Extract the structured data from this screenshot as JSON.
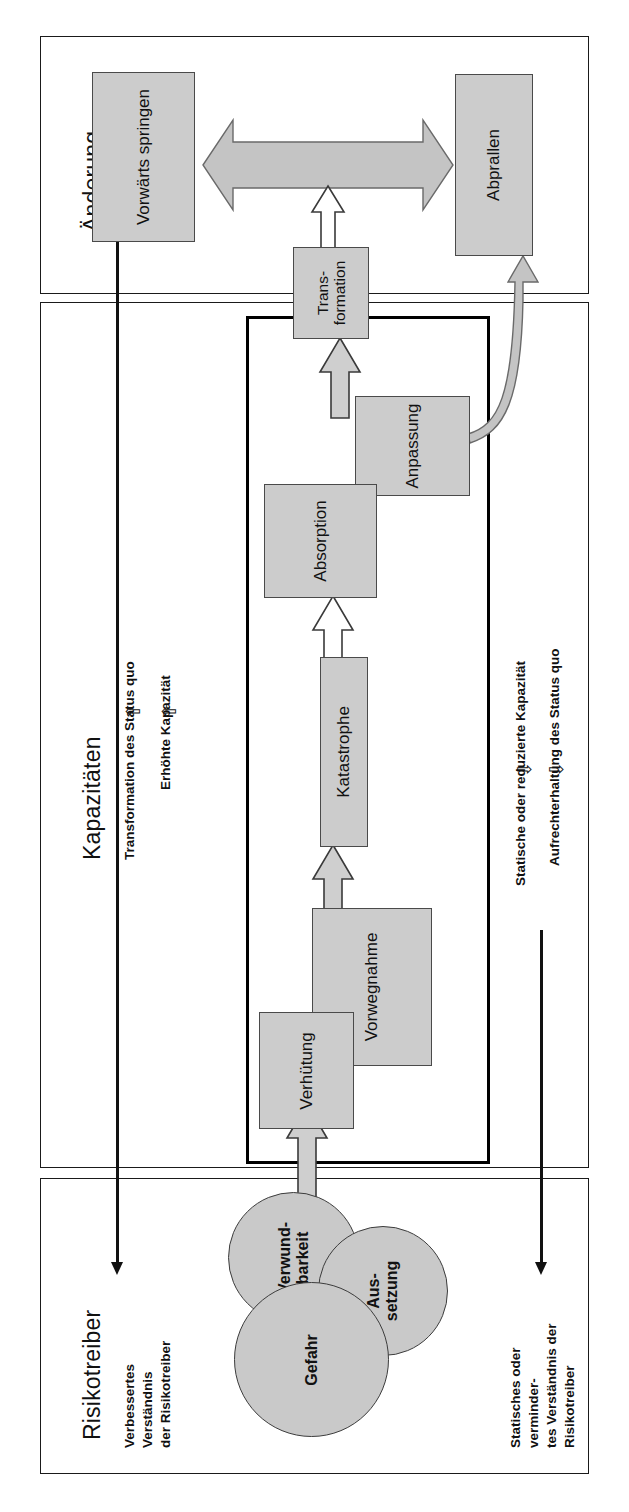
{
  "diagram": {
    "language": "de",
    "orientation": "rotated-90-ccw",
    "colors": {
      "node_fill": "#cccccc",
      "node_stroke": "#4a4a4a",
      "circle_fill": "#c9c9c9",
      "arrow_fill": "#cfcfcf",
      "arrow_stroke": "#3a3a3a",
      "frame_stroke": "#1a1a1a",
      "thickbox_stroke": "#000000",
      "text": "#111111",
      "background": "#ffffff"
    }
  },
  "sections": [
    {
      "id": "aenderung",
      "title": "Änderung"
    },
    {
      "id": "kapazitaeten",
      "title": "Kapazitäten"
    },
    {
      "id": "risikotreiber",
      "title": "Risikotreiber"
    }
  ],
  "nodes": {
    "vorwaerts_springen": "Vorwärts springen",
    "abprallen": "Abprallen",
    "transformation_l1": "Trans-",
    "transformation_l2": "formation",
    "anpassung": "Anpassung",
    "absorption": "Absorption",
    "katastrophe": "Katastrophe",
    "vorwegnahme": "Vorwegnahme",
    "verhuetung": "Verhütung"
  },
  "circles": {
    "verwundbarkeit_l1": "Verwund-",
    "verwundbarkeit_l2": "barkeit",
    "aussetzung_l1": "Aus-",
    "aussetzung_l2": "setzung",
    "gefahr": "Gefahr"
  },
  "side_labels": {
    "transformation_status_quo": "Transformation des Status quo",
    "erhoehte_kapazitaet": "Erhöhte Kapazität",
    "statische_reduzierte_kapazitaet": "Statische oder reduzierte Kapazität",
    "aufrechterhaltung_status_quo": "Aufrechterhaltung des Status quo",
    "verbessertes_verstaendnis_l1": "Verbessertes",
    "verbessertes_verstaendnis_l2": "Verständnis",
    "verbessertes_verstaendnis_l3": "der Risikotreiber",
    "statisches_verstaendnis_l1": "Statisches oder",
    "statisches_verstaendnis_l2": "verminder-",
    "statisches_verstaendnis_l3": "tes Verständnis der",
    "statisches_verstaendnis_l4": "Risikotreiber"
  },
  "glyphs": {
    "up_arrow": "⇧",
    "down_arrow": "⇩"
  },
  "connectors": [
    {
      "name": "circles-to-verhuetung",
      "kind": "block-arrow",
      "direction": "up"
    },
    {
      "name": "vorwegnahme-to-katastrophe",
      "kind": "block-arrow",
      "direction": "up"
    },
    {
      "name": "katastrophe-to-absorption",
      "kind": "block-arrow",
      "direction": "up"
    },
    {
      "name": "anpassung-to-transformation",
      "kind": "block-arrow",
      "direction": "up"
    },
    {
      "name": "transformation-to-double",
      "kind": "block-arrow",
      "direction": "up"
    },
    {
      "name": "anpassung-to-abprallen",
      "kind": "curved-arrow",
      "direction": "up"
    },
    {
      "name": "vorwaerts-abprallen-double",
      "kind": "double-arrow",
      "direction": "horizontal"
    },
    {
      "name": "improving-axis",
      "kind": "line-arrow",
      "direction": "down"
    },
    {
      "name": "static-axis",
      "kind": "line-arrow",
      "direction": "down"
    }
  ]
}
